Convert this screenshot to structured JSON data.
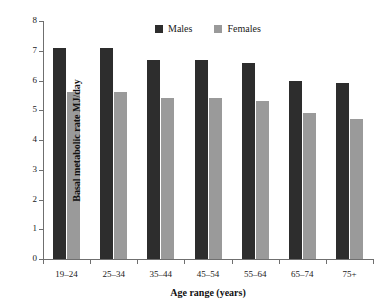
{
  "chart_data": {
    "type": "bar",
    "title": "",
    "xlabel": "Age range (years)",
    "ylabel": "Basal metabolic rate MJ/day",
    "categories": [
      "19–24",
      "25–34",
      "35–44",
      "45–54",
      "55–64",
      "65–74",
      "75+"
    ],
    "series": [
      {
        "name": "Males",
        "color": "#2d2d2d",
        "values": [
          7.1,
          7.1,
          6.7,
          6.7,
          6.6,
          6.0,
          5.9
        ]
      },
      {
        "name": "Females",
        "color": "#9a9a9a",
        "values": [
          5.6,
          5.6,
          5.4,
          5.4,
          5.3,
          4.9,
          4.7
        ]
      }
    ],
    "ylim": [
      0,
      8
    ],
    "yticks": [
      0,
      1,
      2,
      3,
      4,
      5,
      6,
      7,
      8
    ],
    "ytick_labels": [
      "0",
      "1",
      "2",
      "3",
      "4",
      "5",
      "6",
      "7",
      "8"
    ],
    "grid": false,
    "legend_position": "top-center"
  },
  "legend": {
    "entries": [
      {
        "label": "Males"
      },
      {
        "label": "Females"
      }
    ]
  }
}
